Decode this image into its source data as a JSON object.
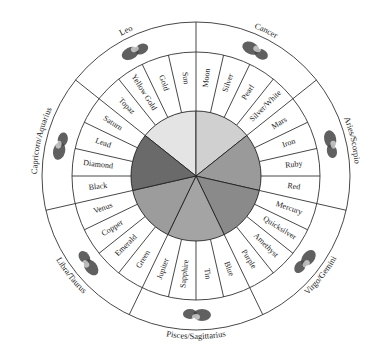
{
  "diagram": {
    "center": [
      196,
      176
    ],
    "radii": {
      "pie": 65,
      "ring_inner": 65,
      "ring_outer": 124,
      "zodiac_outer": 154
    },
    "sectors": [
      {
        "planet": "Sun",
        "zodiac": "Leo",
        "shade": "#e4e4e4",
        "cells_clockwise": [
          "Topaz",
          "Yellow Gold",
          "Gold",
          "Sun"
        ]
      },
      {
        "planet": "Moon",
        "zodiac": "Cancer",
        "shade": "#d0d0d0",
        "cells_clockwise": [
          "Moon",
          "Silver",
          "Pearl",
          "Silver/White"
        ]
      },
      {
        "planet": "Mars",
        "zodiac": "Aries/Scorpio",
        "shade": "#9a9a9a",
        "cells_clockwise": [
          "Mars",
          "Iron",
          "Ruby",
          "Red"
        ]
      },
      {
        "planet": "Mercury",
        "zodiac": "Virgo/Gemini",
        "shade": "#8a8a8a",
        "cells_clockwise": [
          "Mercury",
          "Quicksilver",
          "Amethyst",
          "Purple"
        ]
      },
      {
        "planet": "Jupiter",
        "zodiac": "Pisces/Sagittarius",
        "shade": "#a4a4a4",
        "cells_clockwise": [
          "Blue",
          "Tin",
          "Sapphire",
          "Jupiter"
        ]
      },
      {
        "planet": "Venus",
        "zodiac": "Libra/Taurus",
        "shade": "#9c9c9c",
        "cells_clockwise": [
          "Green",
          "Emerald",
          "Copper",
          "Venus"
        ]
      },
      {
        "planet": "Saturn",
        "zodiac": "Capricorn/Aquarius",
        "shade": "#6a6a6a",
        "cells_clockwise": [
          "Black",
          "Diamond",
          "Lead",
          "Saturn"
        ]
      }
    ],
    "sector_start_angles_deg": [
      308.57,
      0,
      51.43,
      102.86,
      154.29,
      205.71,
      257.14
    ],
    "zodiac_icons": [
      "lion-icon",
      "crab-icon",
      "ram-scorpion-icon",
      "virgin-twins-icon",
      "fish-archer-icon",
      "scales-bull-icon",
      "goat-waterbearer-icon"
    ]
  }
}
